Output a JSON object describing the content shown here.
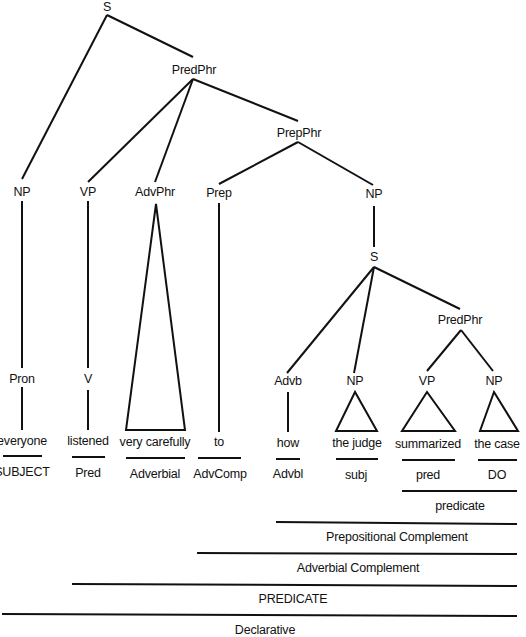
{
  "diagram": {
    "type": "syntax-tree",
    "nodes": {
      "s_root": "S",
      "predphr_main": "PredPhr",
      "np_subject": "NP",
      "vp_main": "VP",
      "advphr": "AdvPhr",
      "prepphr": "PrepPhr",
      "prep": "Prep",
      "np_object": "NP",
      "s_embedded": "S",
      "predphr_embedded": "PredPhr",
      "pron": "Pron",
      "v": "V",
      "advb": "Advb",
      "np_judge": "NP",
      "vp_summarized": "VP",
      "np_case": "NP"
    },
    "words": {
      "everyone": "everyone",
      "listened": "listened",
      "very_carefully": "very carefully",
      "to": "to",
      "how": "how",
      "the_judge": "the judge",
      "summarized": "summarized",
      "the_case": "the case"
    },
    "functions": {
      "subject": "SUBJECT",
      "pred": "Pred",
      "adverbial": "Adverbial",
      "advcomp": "AdvComp",
      "advbl": "Advbl",
      "subj": "subj",
      "pred_lower": "pred",
      "do": "DO"
    },
    "spans": {
      "predicate_lower": "predicate",
      "prepositional_complement": "Prepositional Complement",
      "adverbial_complement": "Adverbial Complement",
      "predicate_upper": "PREDICATE",
      "declarative": "Declarative"
    }
  }
}
